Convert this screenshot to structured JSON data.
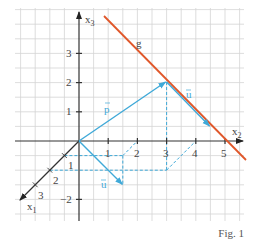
{
  "figure": {
    "caption": "Fig. 1",
    "colors": {
      "vector": "#3fa9d8",
      "line_g": "#e0572a",
      "axis": "#333333",
      "grid": "#d4d4d4"
    },
    "axes": {
      "x1": {
        "label": "x",
        "sub": "1",
        "ticks": [
          "1",
          "2",
          "3"
        ]
      },
      "x2": {
        "label": "x",
        "sub": "2",
        "ticks": [
          "1",
          "2",
          "3",
          "4",
          "5"
        ]
      },
      "x3": {
        "label": "x",
        "sub": "3",
        "ticks": [
          "1",
          "2",
          "3"
        ],
        "negative_ticks": [
          "−2"
        ]
      }
    },
    "line_g": {
      "label": "g"
    },
    "vectors": {
      "p": {
        "label": "p",
        "from": [
          0,
          0,
          0
        ],
        "to": [
          0,
          3,
          2
        ]
      },
      "u_on_g": {
        "label": "u",
        "from": [
          0,
          3,
          2
        ],
        "to": [
          0,
          4.5,
          0.5
        ]
      },
      "u_origin": {
        "label": "u",
        "from": [
          0,
          0,
          0
        ]
      }
    }
  }
}
